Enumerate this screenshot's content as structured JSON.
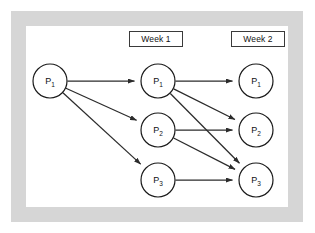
{
  "diagram": {
    "type": "scenario-tree",
    "colors": {
      "frame": "#d6d6d6",
      "panel": "#ffffff",
      "edge": "#2b2b2b",
      "node_stroke": "#1a1a1a",
      "node_fill": "#ffffff",
      "text": "#111111"
    },
    "column_headers": [
      {
        "id": "week1",
        "label": "Week 1"
      },
      {
        "id": "week2",
        "label": "Week 2"
      }
    ],
    "nodes": [
      {
        "id": "root-p1",
        "base": "P",
        "subscript": "1",
        "label": "P1",
        "column": "root",
        "cx": 50,
        "cy": 81,
        "r": 17
      },
      {
        "id": "w1-p1",
        "base": "P",
        "subscript": "1",
        "label": "P1",
        "column": "week1",
        "cx": 158,
        "cy": 81,
        "r": 17
      },
      {
        "id": "w1-p2",
        "base": "P",
        "subscript": "2",
        "label": "P2",
        "column": "week1",
        "cx": 158,
        "cy": 130,
        "r": 17
      },
      {
        "id": "w1-p3",
        "base": "P",
        "subscript": "3",
        "label": "P3",
        "column": "week1",
        "cx": 158,
        "cy": 180,
        "r": 17
      },
      {
        "id": "w2-p1",
        "base": "P",
        "subscript": "1",
        "label": "P1",
        "column": "week2",
        "cx": 256,
        "cy": 81,
        "r": 17
      },
      {
        "id": "w2-p2",
        "base": "P",
        "subscript": "2",
        "label": "P2",
        "column": "week2",
        "cx": 256,
        "cy": 130,
        "r": 17
      },
      {
        "id": "w2-p3",
        "base": "P",
        "subscript": "3",
        "label": "P3",
        "column": "week2",
        "cx": 256,
        "cy": 180,
        "r": 17
      }
    ],
    "edges": [
      {
        "id": "e1",
        "from": "root-p1",
        "to": "w1-p1"
      },
      {
        "id": "e2",
        "from": "root-p1",
        "to": "w1-p2"
      },
      {
        "id": "e3",
        "from": "root-p1",
        "to": "w1-p3"
      },
      {
        "id": "e4",
        "from": "w1-p1",
        "to": "w2-p1"
      },
      {
        "id": "e5",
        "from": "w1-p1",
        "to": "w2-p2"
      },
      {
        "id": "e6",
        "from": "w1-p1",
        "to": "w2-p3"
      },
      {
        "id": "e7",
        "from": "w1-p2",
        "to": "w2-p2"
      },
      {
        "id": "e8",
        "from": "w1-p2",
        "to": "w2-p3"
      },
      {
        "id": "e9",
        "from": "w1-p3",
        "to": "w2-p3"
      }
    ]
  }
}
